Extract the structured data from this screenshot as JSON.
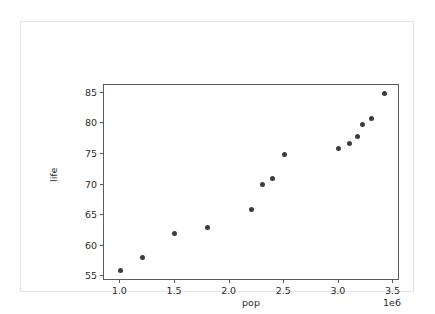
{
  "chart_data": {
    "type": "scatter",
    "title": "",
    "xlabel": "pop",
    "ylabel": "life",
    "x_offset_text": "1e6",
    "x_tick_labels": [
      "1.0",
      "1.5",
      "2.0",
      "2.5",
      "3.0",
      "3.5"
    ],
    "x_ticks": [
      1000000,
      1500000,
      2000000,
      2500000,
      3000000,
      3500000
    ],
    "y_tick_labels": [
      "55",
      "60",
      "65",
      "70",
      "75",
      "80",
      "85"
    ],
    "y_ticks": [
      55,
      60,
      65,
      70,
      75,
      80,
      85
    ],
    "xlim": [
      850000,
      3560000
    ],
    "ylim": [
      54.2,
      86.3
    ],
    "grid": false,
    "legend": null,
    "marker_color": "#3b3b42",
    "axes_color": "#5a5a5a",
    "series": [
      {
        "name": "life vs pop",
        "points": [
          {
            "x": 1000000,
            "y": 56.0
          },
          {
            "x": 1200000,
            "y": 58.0
          },
          {
            "x": 1500000,
            "y": 62.0
          },
          {
            "x": 1800000,
            "y": 62.9
          },
          {
            "x": 2200000,
            "y": 65.9
          },
          {
            "x": 2300000,
            "y": 70.0
          },
          {
            "x": 2390000,
            "y": 71.0
          },
          {
            "x": 2500000,
            "y": 74.9
          },
          {
            "x": 3000000,
            "y": 75.9
          },
          {
            "x": 3100000,
            "y": 76.8
          },
          {
            "x": 3170000,
            "y": 77.8
          },
          {
            "x": 3220000,
            "y": 79.8
          },
          {
            "x": 3300000,
            "y": 80.8
          },
          {
            "x": 3420000,
            "y": 84.9
          }
        ]
      }
    ]
  }
}
